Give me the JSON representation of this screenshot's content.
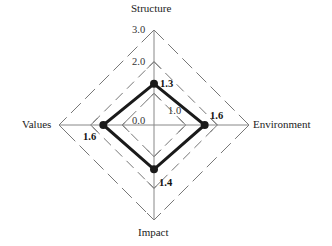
{
  "chart_data": {
    "type": "radar",
    "title": "",
    "axes": [
      "Structure",
      "Environment",
      "Impact",
      "Values"
    ],
    "values": [
      1.3,
      1.6,
      1.4,
      1.6
    ],
    "range": [
      0.0,
      3.0
    ],
    "ticks": [
      "0.0",
      "1.0",
      "2.0",
      "3.0"
    ],
    "value_labels": [
      "1.3",
      "1.6",
      "1.4",
      "1.6"
    ],
    "grid": "dashed diamonds at 1.0, 2.0, 3.0",
    "series_color": "#1a1a1a",
    "grid_color": "#777777"
  }
}
